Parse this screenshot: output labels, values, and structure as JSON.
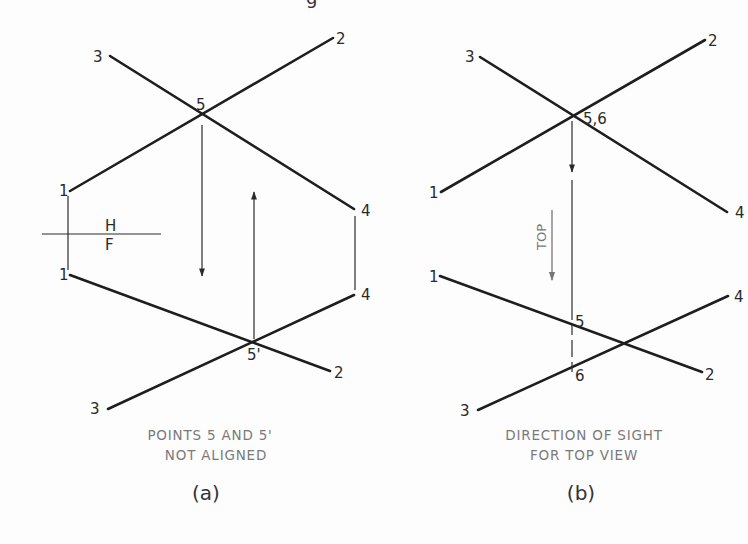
{
  "header": {
    "clipped_heading_fragment": "g"
  },
  "figure_a": {
    "caption_line1": "POINTS 5 AND 5'",
    "caption_line2": "NOT ALIGNED",
    "label": "(a)",
    "fold_line": {
      "above": "H",
      "below": "F"
    },
    "top_view": {
      "points": {
        "1": "1",
        "2": "2",
        "3": "3",
        "4": "4",
        "5": "5"
      }
    },
    "front_view": {
      "points": {
        "1": "1",
        "2": "2",
        "3": "3",
        "4": "4",
        "5p": "5'"
      }
    }
  },
  "figure_b": {
    "caption_line1": "DIRECTION OF SIGHT",
    "caption_line2": "FOR TOP VIEW",
    "label": "(b)",
    "sight_note": "TOP",
    "top_view": {
      "points": {
        "1": "1",
        "2": "2",
        "3": "3",
        "4": "4",
        "56": "5,6"
      }
    },
    "front_view": {
      "points": {
        "1": "1",
        "2": "2",
        "3": "3",
        "4": "4",
        "5": "5",
        "6": "6"
      }
    }
  },
  "colors": {
    "line": "#1e1e1e",
    "caption": "#7a7a7a",
    "background": "#fdfdfd"
  }
}
